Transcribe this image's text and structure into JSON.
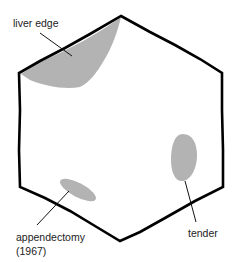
{
  "diagram": {
    "shape": "hexagon",
    "colors": {
      "outline": "#000000",
      "shade": "#b3b3b3",
      "leader": "#111111",
      "text": "#222222"
    },
    "annotations": [
      {
        "id": "liver-edge",
        "label": "liver edge"
      },
      {
        "id": "tender",
        "label": "tender"
      },
      {
        "id": "appendectomy",
        "label": "appendectomy",
        "sublabel": "(1967)"
      }
    ]
  }
}
